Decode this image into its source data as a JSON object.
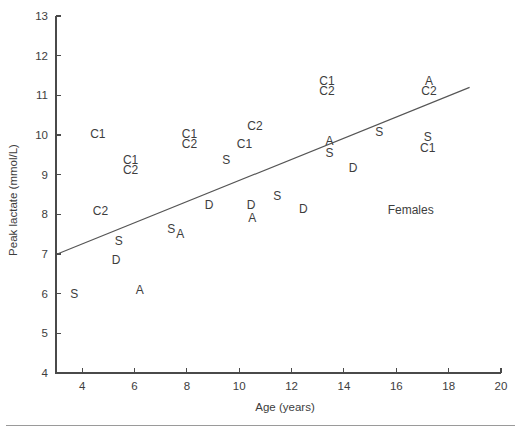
{
  "chart_data": {
    "type": "scatter",
    "title": "",
    "subtitle": "",
    "xlabel": "Age (years)",
    "ylabel": "Peak lactate (mmol/L)",
    "xlim": [
      3,
      20
    ],
    "ylim": [
      4,
      13
    ],
    "xticks": [
      4,
      6,
      8,
      10,
      12,
      14,
      16,
      18,
      20
    ],
    "yticks": [
      4,
      5,
      6,
      7,
      8,
      9,
      10,
      11,
      12,
      13
    ],
    "xtick_labels": [
      "4",
      "6",
      "8",
      "10",
      "12",
      "14",
      "16",
      "18",
      "20"
    ],
    "ytick_labels": [
      "4",
      "5",
      "6",
      "7",
      "8",
      "9",
      "10",
      "11",
      "12",
      "13"
    ],
    "grid": false,
    "legend": false,
    "legend_position": "none",
    "marker_style": "text-letter",
    "annotations": [
      {
        "text": "Females",
        "x": 16.55,
        "y": 8.08
      }
    ],
    "trendlines": [
      {
        "name": "regression-line",
        "x_start": 3.05,
        "y_start": 7.0,
        "x_end": 18.8,
        "y_end": 11.2,
        "style": "solid",
        "color": "#555555"
      }
    ],
    "series": [
      {
        "name": "Subject letter codes",
        "points": [
          {
            "label": "C1",
            "x": 4.6,
            "y": 10.0
          },
          {
            "label": "C2",
            "x": 4.7,
            "y": 8.07
          },
          {
            "label": "S",
            "x": 3.7,
            "y": 5.97
          },
          {
            "label": "D",
            "x": 5.3,
            "y": 6.82
          },
          {
            "label": "S",
            "x": 5.4,
            "y": 7.3
          },
          {
            "label": "C1",
            "x": 5.85,
            "y": 9.35
          },
          {
            "label": "C2",
            "x": 5.85,
            "y": 9.1
          },
          {
            "label": "A",
            "x": 6.2,
            "y": 6.08
          },
          {
            "label": "S",
            "x": 7.4,
            "y": 7.62
          },
          {
            "label": "A",
            "x": 7.75,
            "y": 7.48
          },
          {
            "label": "C1",
            "x": 8.1,
            "y": 10.0
          },
          {
            "label": "C2",
            "x": 8.1,
            "y": 9.75
          },
          {
            "label": "D",
            "x": 8.85,
            "y": 8.22
          },
          {
            "label": "S",
            "x": 9.5,
            "y": 9.35
          },
          {
            "label": "C1",
            "x": 10.2,
            "y": 9.75
          },
          {
            "label": "C2",
            "x": 10.6,
            "y": 10.2
          },
          {
            "label": "D",
            "x": 10.45,
            "y": 8.22
          },
          {
            "label": "A",
            "x": 10.5,
            "y": 7.88
          },
          {
            "label": "S",
            "x": 11.45,
            "y": 8.45
          },
          {
            "label": "D",
            "x": 12.45,
            "y": 8.12
          },
          {
            "label": "C1",
            "x": 13.35,
            "y": 11.35
          },
          {
            "label": "C2",
            "x": 13.35,
            "y": 11.1
          },
          {
            "label": "A",
            "x": 13.45,
            "y": 9.82
          },
          {
            "label": "S",
            "x": 13.45,
            "y": 9.52
          },
          {
            "label": "D",
            "x": 14.35,
            "y": 9.15
          },
          {
            "label": "S",
            "x": 15.35,
            "y": 10.05
          },
          {
            "label": "A",
            "x": 17.25,
            "y": 11.35
          },
          {
            "label": "C2",
            "x": 17.25,
            "y": 11.1
          },
          {
            "label": "S",
            "x": 17.2,
            "y": 9.93
          },
          {
            "label": "C1",
            "x": 17.2,
            "y": 9.65
          }
        ]
      }
    ]
  },
  "axes": {
    "x_title": "Age (years)",
    "y_title": "Peak lactate (mmol/L)"
  },
  "colors": {
    "axis": "#4a4a4a",
    "text": "#3d3d3d",
    "fit_line": "#555555",
    "rule": "#9a9a9a",
    "background": "#ffffff"
  }
}
